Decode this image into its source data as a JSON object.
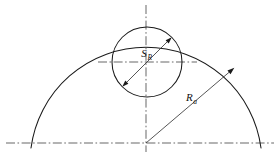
{
  "drawing": {
    "title": "Spherical radius and outer radius dimension diagram",
    "canvas": {
      "width": 279,
      "height": 157,
      "background": "#ffffff"
    },
    "colors": {
      "outline": "#1a1a1a",
      "centerline": "#4d4d4d",
      "leader": "#2b2b2b",
      "label": "#111111"
    },
    "labels": {
      "sphere_radius": {
        "symbol": "S",
        "subscript": "R",
        "x": 152,
        "y": 57
      },
      "outer_radius": {
        "symbol": "R",
        "subscript": "a",
        "x": 186,
        "y": 101
      }
    },
    "geometry": {
      "baseline": {
        "y": 143,
        "x1": 6,
        "x2": 274
      },
      "vertical_centerline": {
        "x": 146,
        "y1": 5,
        "y2": 152
      },
      "circle_centerline": {
        "y": 62,
        "x1": 98,
        "x2": 197
      },
      "large_arc": {
        "cx": 146,
        "cy": 143,
        "r": 116,
        "start_x": 31,
        "end_x": 261,
        "apex_y": 27
      },
      "small_circle": {
        "cx": 147,
        "cy": 62,
        "r": 35
      },
      "sphere_leader": {
        "from_x": 147,
        "from_y": 62,
        "to_x": 172,
        "to_y": 37
      },
      "radius_leader": {
        "from_x": 146,
        "from_y": 143,
        "to_x": 220,
        "to_y": 80
      }
    }
  }
}
